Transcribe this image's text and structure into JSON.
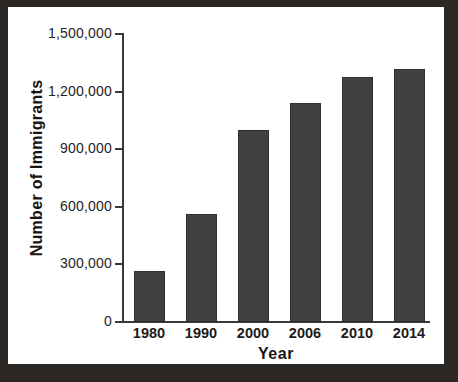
{
  "chart_data": {
    "type": "bar",
    "title": "",
    "subtitle": "",
    "xlabel": "Year",
    "ylabel": "Number of Immigrants",
    "categories": [
      "1980",
      "1990",
      "2000",
      "2006",
      "2010",
      "2014"
    ],
    "values": [
      265000,
      560000,
      1000000,
      1140000,
      1275000,
      1320000
    ],
    "series": [
      {
        "name": "Number of Immigrants",
        "values": [
          265000,
          560000,
          1000000,
          1140000,
          1275000,
          1320000
        ]
      }
    ],
    "ylim": [
      0,
      1500000
    ],
    "ytick_values": [
      0,
      300000,
      600000,
      900000,
      1200000,
      1500000
    ],
    "ytick_labels": [
      "0",
      "300,000",
      "600,000",
      "900,000",
      "1,200,000",
      "1,500,000"
    ],
    "xtick_labels": [
      "1980",
      "1990",
      "2000",
      "2006",
      "2010",
      "2014"
    ],
    "grid": false,
    "legend": null,
    "legend_position": "none",
    "annotations": [],
    "bar_color": "#414141",
    "axis_color": "#3b3835",
    "text_color": "#1d1b19",
    "plot_background": "#ffffff",
    "frame_color": "#2a2724"
  },
  "axes": {
    "x_title": "Year",
    "y_title": "Number of Immigrants"
  }
}
